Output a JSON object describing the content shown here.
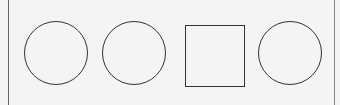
{
  "panel": {
    "shapes": [
      {
        "type": "circle",
        "label": "circle-1"
      },
      {
        "type": "circle",
        "label": "circle-2"
      },
      {
        "type": "square",
        "label": "square-1"
      },
      {
        "type": "circle",
        "label": "circle-3"
      }
    ],
    "colors": {
      "stroke": "#333333",
      "background": "#f4f4f4",
      "border": "#666666"
    }
  }
}
